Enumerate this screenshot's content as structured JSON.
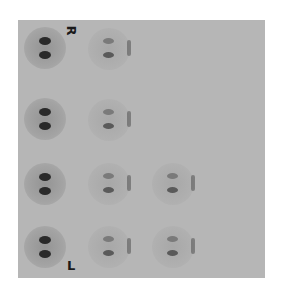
{
  "image": {
    "background_color": "#ffffff",
    "panel_color": "#b6b6b6",
    "spot_color": "#2a2a2a",
    "markers": {
      "top": "R",
      "bottom": "L"
    },
    "grid": {
      "rows": 4,
      "spots_per_row": [
        2,
        2,
        3,
        3
      ]
    }
  }
}
